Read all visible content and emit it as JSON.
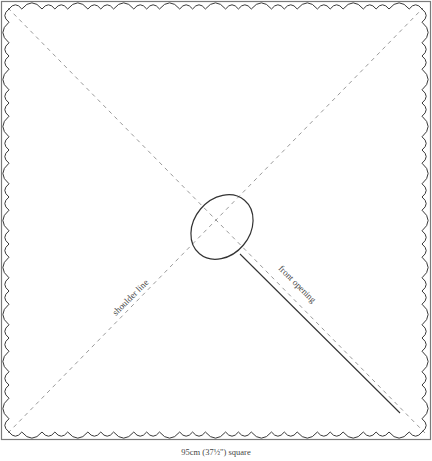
{
  "diagram": {
    "type": "sewing-pattern",
    "labels": {
      "shoulder_line": "shoulder line",
      "front_opening": "front opening",
      "caption": "95cm (37½\") square"
    },
    "colors": {
      "outline": "#7a7a7a",
      "scallop": "#3a3a3a",
      "dashed": "#9a9a9a",
      "neckline": "#333333",
      "text": "#444444"
    },
    "elements": [
      {
        "name": "outer-square",
        "shape": "rectangle"
      },
      {
        "name": "scalloped-edge",
        "shape": "scalloped border"
      },
      {
        "name": "diagonal-shoulder-line",
        "style": "dashed",
        "from": "bottom-left",
        "to": "top-right"
      },
      {
        "name": "diagonal-line",
        "style": "dashed",
        "from": "top-left",
        "to": "bottom-right"
      },
      {
        "name": "neck-opening",
        "shape": "ellipse"
      },
      {
        "name": "front-opening-cut",
        "style": "solid",
        "from": "neck-opening",
        "to": "bottom-right"
      }
    ]
  }
}
